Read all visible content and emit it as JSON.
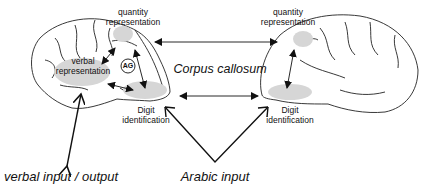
{
  "diagram": {
    "left_hemisphere": {
      "quantity_label_line1": "quantity",
      "quantity_label_line2": "representation",
      "verbal_label_line1": "verbal",
      "verbal_label_line2": "representation",
      "ag_label": "AG",
      "digit_label_line1": "Digit",
      "digit_label_line2": "identification"
    },
    "right_hemisphere": {
      "quantity_label_line1": "quantity",
      "quantity_label_line2": "representation",
      "digit_label_line1": "Digit",
      "digit_label_line2": "identification"
    },
    "corpus_callosum_label": "Corpus callosum",
    "verbal_io_label": "verbal input / output",
    "arabic_input_label": "Arabic input",
    "colors": {
      "region_fill": "#d6d6d6",
      "line": "#111111"
    }
  }
}
